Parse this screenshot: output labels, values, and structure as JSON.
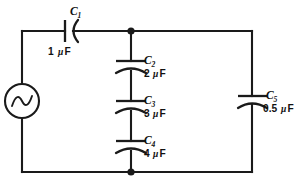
{
  "diagram": {
    "type": "electrical-circuit-schematic",
    "width": 298,
    "height": 185,
    "background_color": "#ffffff",
    "line_color": "#1a1a1a"
  },
  "source": {
    "name": "ac-voltage-source",
    "symbol": "sine-wave-in-circle",
    "label": ""
  },
  "components": [
    {
      "id": "c1",
      "designator": "C",
      "subscript": "1",
      "value": "1",
      "mu": "μ",
      "unit": "F",
      "value_text": "1 μF",
      "orientation": "horizontal",
      "symbol": "polarized-capacitor",
      "branch": "top-series"
    },
    {
      "id": "c2",
      "designator": "C",
      "subscript": "2",
      "value": "2",
      "mu": "μ",
      "unit": "F",
      "value_text": "2 μF",
      "orientation": "vertical",
      "symbol": "polarized-capacitor",
      "branch": "middle-series"
    },
    {
      "id": "c3",
      "designator": "C",
      "subscript": "3",
      "value": "3",
      "mu": "μ",
      "unit": "F",
      "value_text": "3 μF",
      "orientation": "vertical",
      "symbol": "polarized-capacitor",
      "branch": "middle-series"
    },
    {
      "id": "c4",
      "designator": "C",
      "subscript": "4",
      "value": "4",
      "mu": "μ",
      "unit": "F",
      "value_text": "4 μF",
      "orientation": "vertical",
      "symbol": "polarized-capacitor",
      "branch": "middle-series"
    },
    {
      "id": "c5",
      "designator": "C",
      "subscript": "5",
      "value": "0.5",
      "mu": "μ",
      "unit": "F",
      "value_text": "0.5 μF",
      "orientation": "vertical",
      "symbol": "polarized-capacitor",
      "branch": "right-leg"
    }
  ],
  "nodes": [
    {
      "id": "node-top",
      "x": 131,
      "y": 31,
      "style": "filled-junction-dot"
    },
    {
      "id": "node-bottom",
      "x": 131,
      "y": 172,
      "style": "filled-junction-dot"
    }
  ]
}
